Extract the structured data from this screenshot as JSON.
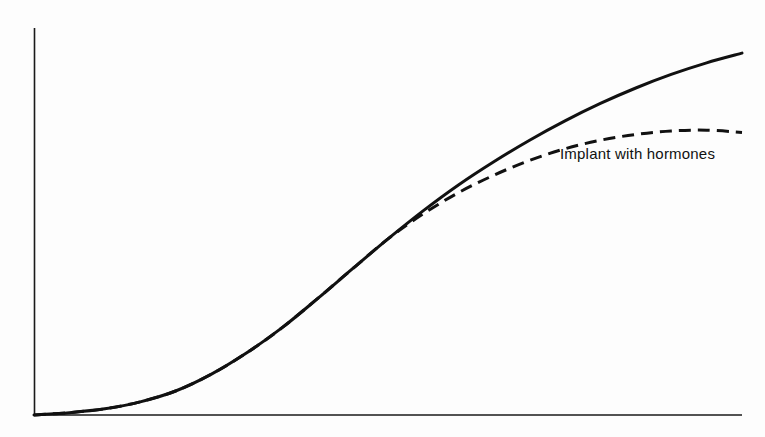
{
  "chart_data": {
    "type": "line",
    "title": "",
    "subtitle": "",
    "xlabel": "",
    "ylabel": "",
    "xlim": [
      0,
      100
    ],
    "ylim": [
      0,
      100
    ],
    "grid": false,
    "legend_position": "inline-annotation",
    "axes": {
      "x_axis_visible": true,
      "y_axis_visible": true,
      "x_tick_labels": [],
      "y_tick_labels": [],
      "axis_color": "#1a1a1a",
      "origin_px": [
        34,
        415
      ],
      "x_axis_end_px": [
        742,
        415
      ],
      "y_axis_top_px": [
        34,
        28
      ]
    },
    "series": [
      {
        "name": "Implant without hormones",
        "style": "solid",
        "color": "#111111",
        "line_width": 3,
        "annotation": "",
        "points": [
          [
            0,
            0
          ],
          [
            5,
            0.6
          ],
          [
            10,
            1.6
          ],
          [
            15,
            3.4
          ],
          [
            20,
            6.2
          ],
          [
            25,
            10.5
          ],
          [
            30,
            16.0
          ],
          [
            35,
            22.5
          ],
          [
            40,
            30.0
          ],
          [
            45,
            37.8
          ],
          [
            50,
            45.5
          ],
          [
            55,
            52.8
          ],
          [
            60,
            59.5
          ],
          [
            65,
            65.5
          ],
          [
            70,
            71.0
          ],
          [
            75,
            76.0
          ],
          [
            80,
            80.5
          ],
          [
            85,
            84.5
          ],
          [
            90,
            88.0
          ],
          [
            95,
            91.0
          ],
          [
            100,
            93.5
          ]
        ]
      },
      {
        "name": "Implant with hormones",
        "style": "dashed",
        "color": "#111111",
        "line_width": 3,
        "dash_pattern": "12 7",
        "annotation": "Implant with hormones",
        "points": [
          [
            0,
            0
          ],
          [
            5,
            0.6
          ],
          [
            10,
            1.6
          ],
          [
            15,
            3.4
          ],
          [
            20,
            6.2
          ],
          [
            25,
            10.5
          ],
          [
            30,
            16.0
          ],
          [
            35,
            22.5
          ],
          [
            40,
            30.0
          ],
          [
            45,
            37.8
          ],
          [
            50,
            45.5
          ],
          [
            55,
            52.0
          ],
          [
            60,
            57.5
          ],
          [
            65,
            62.0
          ],
          [
            70,
            65.8
          ],
          [
            75,
            68.8
          ],
          [
            80,
            71.0
          ],
          [
            85,
            72.5
          ],
          [
            90,
            73.4
          ],
          [
            95,
            73.6
          ],
          [
            100,
            73.0
          ]
        ]
      }
    ],
    "annotations": [
      {
        "text": "Implant with hormones",
        "x_px": 560,
        "y_px": 146,
        "font_size_px": 15,
        "color": "#111111"
      }
    ]
  },
  "colors": {
    "background": "#fdfdfd",
    "ink": "#111111",
    "axis": "#1a1a1a"
  }
}
